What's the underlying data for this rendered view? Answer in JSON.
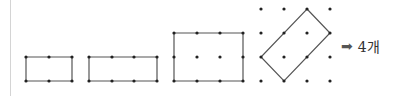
{
  "colors": {
    "line": "#555555",
    "dot": "#222222",
    "rule": "#d4d4d4"
  },
  "figures": [
    {
      "name": "rect-2x1",
      "dots": [
        [
          26,
          57
        ],
        [
          49,
          57
        ],
        [
          72,
          57
        ],
        [
          26,
          81
        ],
        [
          49,
          81
        ],
        [
          72,
          81
        ]
      ],
      "polygon": [
        [
          26,
          57
        ],
        [
          72,
          57
        ],
        [
          72,
          81
        ],
        [
          26,
          81
        ]
      ]
    },
    {
      "name": "rect-3x1",
      "dots": [
        [
          89,
          57
        ],
        [
          112,
          57
        ],
        [
          134,
          57
        ],
        [
          157,
          57
        ],
        [
          89,
          81
        ],
        [
          112,
          81
        ],
        [
          134,
          81
        ],
        [
          157,
          81
        ]
      ],
      "polygon": [
        [
          89,
          57
        ],
        [
          157,
          57
        ],
        [
          157,
          81
        ],
        [
          89,
          81
        ]
      ]
    },
    {
      "name": "rect-3x2",
      "dots": [
        [
          174,
          33
        ],
        [
          197,
          33
        ],
        [
          220,
          33
        ],
        [
          243,
          33
        ],
        [
          174,
          57
        ],
        [
          197,
          57
        ],
        [
          220,
          57
        ],
        [
          243,
          57
        ],
        [
          174,
          81
        ],
        [
          197,
          81
        ],
        [
          220,
          81
        ],
        [
          243,
          81
        ]
      ],
      "polygon": [
        [
          174,
          33
        ],
        [
          243,
          33
        ],
        [
          243,
          81
        ],
        [
          174,
          81
        ]
      ]
    },
    {
      "name": "tilted-rect",
      "dots": [
        [
          261,
          9
        ],
        [
          284,
          9
        ],
        [
          307,
          9
        ],
        [
          330,
          9
        ],
        [
          261,
          33
        ],
        [
          284,
          33
        ],
        [
          307,
          33
        ],
        [
          330,
          33
        ],
        [
          261,
          57
        ],
        [
          284,
          57
        ],
        [
          307,
          57
        ],
        [
          330,
          57
        ],
        [
          261,
          81
        ],
        [
          284,
          81
        ],
        [
          307,
          81
        ],
        [
          330,
          81
        ]
      ],
      "polygon": [
        [
          307,
          9
        ],
        [
          330,
          33
        ],
        [
          284,
          81
        ],
        [
          261,
          57
        ]
      ]
    }
  ],
  "answer": {
    "arrow": "➡",
    "text": "4개"
  }
}
